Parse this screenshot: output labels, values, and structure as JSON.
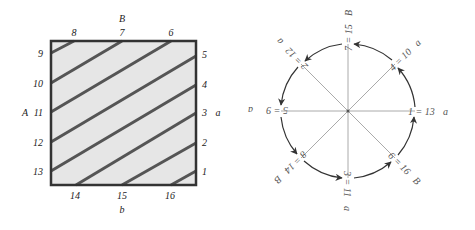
{
  "left_diagram": {
    "title": "square-identification",
    "edge_labels": {
      "top": "B",
      "bottom": "b",
      "left": "A",
      "right": "a"
    },
    "top_points": [
      "8",
      "7",
      "6"
    ],
    "bottom_points": [
      "14",
      "15",
      "16"
    ],
    "left_points": [
      "9",
      "10",
      "11",
      "12",
      "13"
    ],
    "right_points": [
      "5",
      "4",
      "3",
      "2",
      "1"
    ],
    "segments": [
      [
        "9",
        "8"
      ],
      [
        "10",
        "7"
      ],
      [
        "11",
        "6"
      ],
      [
        "12",
        "5"
      ],
      [
        "13",
        "4"
      ],
      [
        "14",
        "3"
      ],
      [
        "15",
        "2"
      ],
      [
        "16",
        "1"
      ]
    ],
    "colors": {
      "fill": "#e6e6e6",
      "border": "#333333",
      "stripe": "#555555"
    }
  },
  "right_diagram": {
    "title": "circle-cycle",
    "nodes": [
      {
        "label": "1 = 13",
        "edge": "a",
        "angle": 0
      },
      {
        "label": "4 = 10",
        "edge": "a",
        "angle": 45
      },
      {
        "label": "7 = 15",
        "edge": "B",
        "angle": 90
      },
      {
        "label": "2 = 12",
        "edge": "a",
        "angle": 135
      },
      {
        "label": "5 = 9",
        "edge": "a",
        "angle": 180
      },
      {
        "label": "8 = 14",
        "edge": "B",
        "angle": 225
      },
      {
        "label": "3 = 11",
        "edge": "a",
        "angle": 270
      },
      {
        "label": "6 = 16",
        "edge": "B",
        "angle": 315
      }
    ],
    "arrow_order": [
      "1",
      "4",
      "7",
      "2",
      "5",
      "8",
      "3",
      "6",
      "1"
    ],
    "colors": {
      "circle": "#333333",
      "spokes": "#aaaaaa",
      "text": "#555555"
    }
  }
}
